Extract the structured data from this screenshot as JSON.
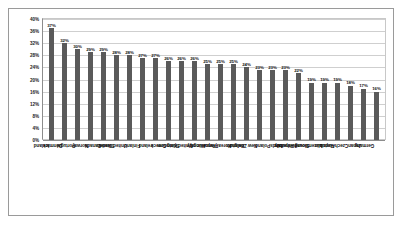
{
  "chart_data": {
    "type": "bar",
    "title": "",
    "xlabel": "",
    "ylabel": "",
    "ylim": [
      0,
      40
    ],
    "ytick_step": 4,
    "grid": true,
    "legend": "none",
    "value_suffix": "%",
    "bar_color": "#5a5a5a",
    "categories": [
      "Iceland",
      "Denmark",
      "Portugal",
      "Norway",
      "Canada",
      "Sweden",
      "United States",
      "Finland",
      "Ireland",
      "Greece",
      "Spain",
      "United Kingdom",
      "Hungary",
      "France",
      "Korea (Republic of)",
      "Belgium",
      "New Zealand",
      "Poland",
      "Italy",
      "Netherlands",
      "Slovak Republic",
      "Luxembourg",
      "Austria",
      "Czech Republic",
      "Japan",
      "Germany"
    ],
    "values": [
      37,
      32,
      30,
      29,
      29,
      28,
      28,
      27,
      27,
      26,
      26,
      26,
      25,
      25,
      25,
      24,
      23,
      23,
      23,
      22,
      19,
      19,
      19,
      18,
      17,
      16
    ],
    "value_labels": [
      "37%",
      "32%",
      "30%",
      "29%",
      "29%",
      "28%",
      "28%",
      "27%",
      "27%",
      "26%",
      "26%",
      "26%",
      "25%",
      "25%",
      "25%",
      "24%",
      "23%",
      "23%",
      "23%",
      "22%",
      "19%",
      "19%",
      "19%",
      "18%",
      "17%",
      "16%"
    ],
    "ytick_labels": [
      "40%",
      "36%",
      "32%",
      "28%",
      "24%",
      "20%",
      "16%",
      "12%",
      "8%",
      "4%",
      "0%"
    ],
    "ytick_values": [
      40,
      36,
      32,
      28,
      24,
      20,
      16,
      12,
      8,
      4,
      0
    ]
  },
  "caption": {
    "text": ""
  }
}
